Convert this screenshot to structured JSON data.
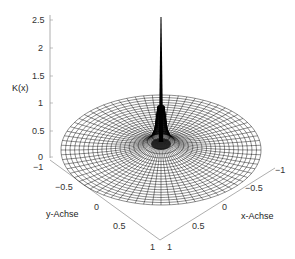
{
  "chart_data": {
    "type": "surface3d",
    "title": "",
    "function": "K(x) - radially symmetric kernel, sharp singular peak at origin, zero outside unit disk",
    "xlabel": "x-Achse",
    "ylabel": "y-Achse",
    "zlabel": "K(x)",
    "xlim": [
      -1,
      1
    ],
    "ylim": [
      -1,
      1
    ],
    "zlim": [
      0,
      2.5
    ],
    "x_ticks": [
      "-1",
      "-0.5",
      "0",
      "0.5",
      "1"
    ],
    "y_ticks": [
      "-1",
      "-0.5",
      "0",
      "0.5",
      "1"
    ],
    "z_ticks": [
      "0",
      "0.5",
      "1",
      "1.5",
      "2",
      "2.5"
    ],
    "grid": false,
    "mesh": "polar wireframe (radial and concentric lines)",
    "peak": {
      "x": 0,
      "y": 0,
      "z": 2.5
    },
    "support_radius": 1,
    "line_color": "#000000",
    "background_color": "#ffffff"
  },
  "labels": {
    "z_axis": "K(x)",
    "x_axis": "x-Achse",
    "y_axis": "y-Achse"
  },
  "ticks": {
    "z": [
      "2.5",
      "2",
      "1.5",
      "1",
      "0.5",
      "0"
    ],
    "y": [
      "−1",
      "−0.5",
      "0",
      "0.5",
      "1"
    ],
    "x": [
      "−1",
      "−0.5",
      "0",
      "0.5",
      "1"
    ]
  }
}
